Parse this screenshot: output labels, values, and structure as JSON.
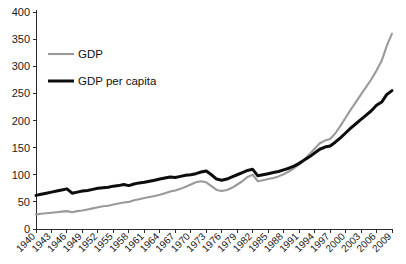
{
  "chart_data": {
    "type": "line",
    "title": "",
    "xlabel": "",
    "ylabel": "",
    "ylim": [
      0,
      400
    ],
    "xlim": [
      1940,
      2009
    ],
    "grid": false,
    "legend_position": "upper-left",
    "ytick_labels": [
      "0",
      "50",
      "100",
      "150",
      "200",
      "250",
      "300",
      "350",
      "400"
    ],
    "ytick_values": [
      0,
      50,
      100,
      150,
      200,
      250,
      300,
      350,
      400
    ],
    "xtick_labels": [
      "1940",
      "1943",
      "1946",
      "1949",
      "1952",
      "1955",
      "1958",
      "1961",
      "1964",
      "1967",
      "1970",
      "1973",
      "1976",
      "1979",
      "1982",
      "1985",
      "1988",
      "1991",
      "1994",
      "1997",
      "2000",
      "2003",
      "2006",
      "2009"
    ],
    "xtick_values": [
      1940,
      1943,
      1946,
      1949,
      1952,
      1955,
      1958,
      1961,
      1964,
      1967,
      1970,
      1973,
      1976,
      1979,
      1982,
      1985,
      1988,
      1991,
      1994,
      1997,
      2000,
      2003,
      2006,
      2009
    ],
    "x": [
      1940,
      1941,
      1942,
      1943,
      1944,
      1945,
      1946,
      1947,
      1948,
      1949,
      1950,
      1951,
      1952,
      1953,
      1954,
      1955,
      1956,
      1957,
      1958,
      1959,
      1960,
      1961,
      1962,
      1963,
      1964,
      1965,
      1966,
      1967,
      1968,
      1969,
      1970,
      1971,
      1972,
      1973,
      1974,
      1975,
      1976,
      1977,
      1978,
      1979,
      1980,
      1981,
      1982,
      1983,
      1984,
      1985,
      1986,
      1987,
      1988,
      1989,
      1990,
      1991,
      1992,
      1993,
      1994,
      1995,
      1996,
      1997,
      1998,
      1999,
      2000,
      2001,
      2002,
      2003,
      2004,
      2005,
      2006,
      2007,
      2008,
      2009
    ],
    "series": [
      {
        "name": "GDP",
        "color": "#9a9a9a",
        "width": 2.1,
        "values": [
          27,
          28,
          29,
          30,
          31,
          32,
          33,
          31,
          33,
          34,
          36,
          38,
          40,
          42,
          43,
          45,
          47,
          49,
          50,
          53,
          55,
          57,
          59,
          61,
          63,
          66,
          69,
          71,
          74,
          78,
          82,
          86,
          88,
          86,
          79,
          72,
          70,
          72,
          76,
          82,
          88,
          96,
          100,
          88,
          90,
          92,
          94,
          97,
          101,
          106,
          112,
          119,
          128,
          138,
          148,
          158,
          163,
          166,
          176,
          190,
          205,
          220,
          234,
          248,
          262,
          276,
          292,
          310,
          338,
          360
        ]
      },
      {
        "name": "GDP per capita",
        "color": "#0d0d0d",
        "width": 3.0,
        "values": [
          62,
          64,
          66,
          68,
          70,
          72,
          74,
          66,
          68,
          70,
          71,
          73,
          75,
          76,
          77,
          79,
          80,
          82,
          80,
          83,
          85,
          86,
          88,
          90,
          92,
          94,
          96,
          95,
          97,
          99,
          100,
          102,
          105,
          107,
          100,
          92,
          90,
          92,
          96,
          100,
          104,
          108,
          110,
          98,
          100,
          102,
          104,
          106,
          109,
          112,
          116,
          121,
          127,
          133,
          140,
          147,
          151,
          153,
          160,
          168,
          177,
          186,
          194,
          202,
          210,
          218,
          228,
          234,
          248,
          255
        ]
      }
    ],
    "legend": [
      {
        "label": "GDP",
        "color": "#9a9a9a",
        "width": 2.1
      },
      {
        "label": "GDP per capita",
        "color": "#0d0d0d",
        "width": 3.0
      }
    ]
  }
}
